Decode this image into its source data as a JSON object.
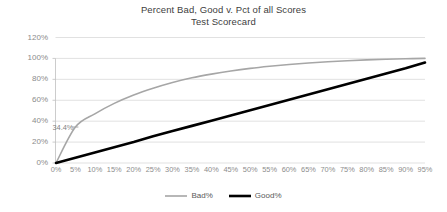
{
  "chart_data": {
    "type": "line",
    "title": "Percent Bad, Good v. Pct of all Scores",
    "subtitle": "Test Scorecard",
    "xlabel": "",
    "ylabel": "",
    "grid": true,
    "legend_position": "bottom",
    "ylim": [
      0,
      120
    ],
    "yticks": [
      "0%",
      "20%",
      "40%",
      "60%",
      "80%",
      "100%",
      "120%"
    ],
    "ytick_values": [
      0,
      20,
      40,
      60,
      80,
      100,
      120
    ],
    "categories": [
      "0%",
      "5%",
      "10%",
      "15%",
      "20%",
      "25%",
      "30%",
      "35%",
      "40%",
      "45%",
      "50%",
      "55%",
      "60%",
      "65%",
      "70%",
      "75%",
      "80%",
      "85%",
      "90%",
      "95%"
    ],
    "series": [
      {
        "name": "Bad%",
        "color": "#a6a6a6",
        "width": 1.6,
        "values": [
          0,
          34.4,
          47,
          57,
          65,
          71.5,
          77,
          81.5,
          85,
          88,
          90.5,
          92.5,
          94.2,
          95.6,
          96.8,
          97.8,
          98.6,
          99.2,
          99.7,
          100
        ]
      },
      {
        "name": "Good%",
        "color": "#000000",
        "width": 2.6,
        "values": [
          0,
          5,
          10,
          15,
          20,
          25.5,
          30.5,
          35.5,
          40.5,
          45.5,
          50.5,
          55.5,
          60.5,
          65.5,
          70.5,
          75.5,
          80.5,
          85.5,
          90.5,
          96
        ]
      }
    ],
    "annotations": [
      {
        "text": "34.4%",
        "series": "Bad%",
        "category": "5%",
        "value": 34.4
      }
    ]
  },
  "legend": {
    "items": [
      {
        "label": "Bad%"
      },
      {
        "label": "Good%"
      }
    ]
  }
}
